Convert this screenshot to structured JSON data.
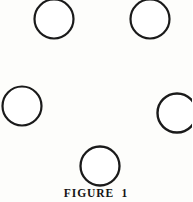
{
  "page": {
    "background_color": "#fdfdfb",
    "width": 192,
    "height": 202
  },
  "caption": {
    "text": "FIGURE  1",
    "label_word": "FIGURE",
    "number": "1",
    "color": "#141414"
  },
  "diagram": {
    "title": "FIGURE  1",
    "shape_type": "circle",
    "count": 5,
    "stroke_color": "#1a1a1a",
    "fill_color": "#ffffff",
    "circles": [
      {
        "name": "circle-top-left",
        "cx": 54,
        "cy": 19,
        "r": 19.5,
        "stroke_width": 2.2,
        "clipped_edge": "top"
      },
      {
        "name": "circle-top-right",
        "cx": 150,
        "cy": 19,
        "r": 19.5,
        "stroke_width": 2.2,
        "clipped_edge": "top"
      },
      {
        "name": "circle-middle-left",
        "cx": 22,
        "cy": 106,
        "r": 19.5,
        "stroke_width": 2.2,
        "clipped_edge": "none"
      },
      {
        "name": "circle-middle-right",
        "cx": 177,
        "cy": 113,
        "r": 19.5,
        "stroke_width": 2.4,
        "clipped_edge": "right"
      },
      {
        "name": "circle-bottom-center",
        "cx": 100,
        "cy": 166,
        "r": 19.5,
        "stroke_width": 2.3,
        "clipped_edge": "none"
      }
    ]
  }
}
